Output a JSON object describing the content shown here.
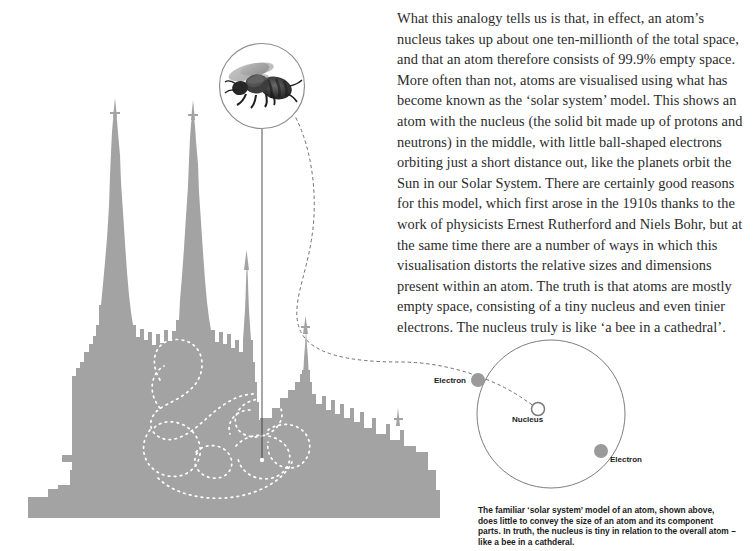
{
  "page": {
    "background_color": "#ffffff",
    "width": 754,
    "height": 551
  },
  "body_text": {
    "paragraph": "What this analogy tells us is that, in effect, an atom’s nucleus takes up about one ten-millionth of the total space, and that an atom therefore consists of 99.9% empty space. More often than not, atoms are visualised using what has become known as the ‘solar system’ model. This shows an atom with the nucleus (the solid bit made up of protons and neutrons) in the middle, with little ball-shaped electrons orbiting just a short distance out, like the planets orbit the Sun in our Solar System. There are certainly good reasons for this model, which first arose in the 1910s thanks to the work of physicists Ernest Rutherford and Niels Bohr, but at the same time there are a number of ways in which this visualisation distorts the relative sizes and dimensions present within an atom. The truth is that atoms are mostly empty space, consisting of a tiny nucleus and even tinier electrons. The nucleus truly is like ‘a bee in a cathedral’."
  },
  "caption": {
    "text": "The familiar ‘solar system’ model of an atom, shown above, does little to convey the size of an atom and its component parts. In truth, the nucleus is tiny in relation to the overall atom – like a bee in a cathderal."
  },
  "atom_diagram": {
    "orbit_label": "",
    "nucleus_label": "Nucleus",
    "electron_left_label": "Electron",
    "electron_right_label": "Electron",
    "colors": {
      "orbit_stroke": "#6e6e6e",
      "electron_fill": "#9a9a9a",
      "nucleus_stroke": "#7a7a7a",
      "label_color": "#1b1b1b"
    },
    "geometry": {
      "orbit_center_x": 551,
      "orbit_center_y": 414,
      "orbit_radius": 74,
      "nucleus_x": 538,
      "nucleus_y": 409,
      "nucleus_radius": 7,
      "electron_left_x": 478,
      "electron_left_y": 380,
      "electron_right_x": 601,
      "electron_right_y": 451,
      "electron_radius": 7
    }
  },
  "cathedral": {
    "silhouette_color": "#a3a3a3",
    "flight_path_color": "#ffffff",
    "leader_line_color": "#3b3b3b"
  },
  "bee_inset": {
    "circle_center_x": 262,
    "circle_center_y": 86,
    "circle_radius": 43,
    "ring_color": "#8f8f8f",
    "bee_color": "#2a2a2a"
  },
  "connector": {
    "dash_color": "#6e6e6e"
  }
}
